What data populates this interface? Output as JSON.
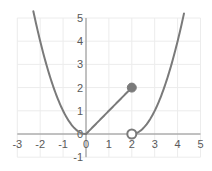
{
  "chart_data": {
    "type": "line",
    "title": "",
    "xlabel": "",
    "ylabel": "",
    "xlim": [
      -3,
      5
    ],
    "ylim": [
      -1,
      5
    ],
    "grid": true,
    "x_ticks": [
      -3,
      -2,
      -1,
      0,
      1,
      2,
      3,
      4,
      5
    ],
    "y_ticks": [
      -1,
      0,
      1,
      2,
      3,
      4,
      5
    ],
    "x_tick_labels": [
      "-3",
      "-2",
      "-1",
      "0",
      "1",
      "2",
      "3",
      "4",
      "5"
    ],
    "y_tick_labels": [
      "-1",
      "0",
      "1",
      "2",
      "3",
      "4",
      "5"
    ],
    "series": [
      {
        "name": "f(x) = x^2, x <= 0",
        "domain": [
          -2.3,
          0
        ],
        "expression": "x^2"
      },
      {
        "name": "f(x) = x, 0 <= x <= 2",
        "domain": [
          0,
          2
        ],
        "expression": "x",
        "x": [
          0,
          2
        ],
        "y": [
          0,
          2
        ]
      },
      {
        "name": "f(x) = (x-2)^2, x > 2",
        "domain": [
          2,
          4.28
        ],
        "expression": "(x-2)^2"
      }
    ],
    "points": [
      {
        "x": 2,
        "y": 2,
        "style": "closed"
      },
      {
        "x": 2,
        "y": 0,
        "style": "open"
      }
    ],
    "colors": {
      "curve": "#7a7a7a",
      "axis": "#8c8c8c",
      "grid": "#ececec",
      "label": "#595959"
    }
  }
}
